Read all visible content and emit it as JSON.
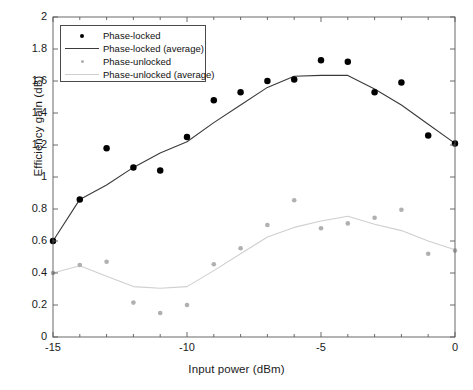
{
  "chart_data": {
    "type": "scatter",
    "title": "",
    "xlabel": "Input power (dBm)",
    "ylabel": "Efficiency gain (dB)",
    "xlim": [
      -15,
      0
    ],
    "ylim": [
      0,
      2
    ],
    "xticks": [
      -15,
      -10,
      -5,
      0
    ],
    "xtick_labels": [
      "-15",
      "-10",
      "-5",
      "0"
    ],
    "xticks_minor": [
      -14,
      -13,
      -12,
      -11,
      -9,
      -8,
      -7,
      -6,
      -4,
      -3,
      -2,
      -1
    ],
    "yticks": [
      0,
      0.2,
      0.4,
      0.6,
      0.8,
      1,
      1.2,
      1.4,
      1.6,
      1.8,
      2
    ],
    "ytick_labels": [
      "0",
      "0.2",
      "0.4",
      "0.6",
      "0.8",
      "1",
      "1.2",
      "1.4",
      "1.6",
      "1.8",
      "2"
    ],
    "grid": false,
    "legend_position": "upper left",
    "x": [
      -15,
      -14,
      -13,
      -12,
      -11,
      -10,
      -9,
      -8,
      -7,
      -6,
      -5,
      -4,
      -3,
      -2,
      -1,
      0
    ],
    "series": [
      {
        "name": "Phase-locked",
        "kind": "scatter",
        "color": "#000000",
        "marker": "circle",
        "marker_size": 5,
        "values": [
          0.6,
          0.86,
          1.18,
          1.06,
          1.04,
          1.25,
          1.48,
          1.53,
          1.6,
          1.61,
          1.73,
          1.72,
          1.53,
          1.59,
          1.26,
          1.21
        ]
      },
      {
        "name": "Phase-locked (average)",
        "kind": "line",
        "color": "#3a3a3a",
        "line_width": 1.1,
        "values": [
          0.6,
          0.86,
          0.95,
          1.06,
          1.15,
          1.22,
          1.34,
          1.45,
          1.56,
          1.63,
          1.635,
          1.635,
          1.55,
          1.45,
          1.33,
          1.21
        ]
      },
      {
        "name": "Phase-unlocked",
        "kind": "scatter",
        "color": "#b0b0b0",
        "marker": "circle",
        "marker_size": 3.6,
        "values": [
          0.4,
          0.45,
          0.47,
          0.215,
          0.15,
          0.2,
          0.455,
          0.555,
          0.7,
          0.855,
          0.68,
          0.71,
          0.745,
          0.795,
          0.52,
          0.54
        ]
      },
      {
        "name": "Phase-unlocked (average)",
        "kind": "line",
        "color": "#cfcfcf",
        "line_width": 1.1,
        "values": [
          0.4,
          0.445,
          0.38,
          0.315,
          0.305,
          0.315,
          0.415,
          0.52,
          0.625,
          0.685,
          0.725,
          0.755,
          0.705,
          0.665,
          0.6,
          0.545
        ]
      }
    ]
  },
  "legend": {
    "entries": [
      {
        "label": "Phase-locked",
        "type": "marker",
        "color": "#000000"
      },
      {
        "label": "Phase-locked (average)",
        "type": "line",
        "color": "#3a3a3a"
      },
      {
        "label": "Phase-unlocked",
        "type": "marker",
        "color": "#b0b0b0"
      },
      {
        "label": "Phase-unlocked (average)",
        "type": "line",
        "color": "#cfcfcf"
      }
    ]
  },
  "axes": {
    "x_title": "Input power (dBm)",
    "y_title": "Efficiency gain (dB)"
  }
}
